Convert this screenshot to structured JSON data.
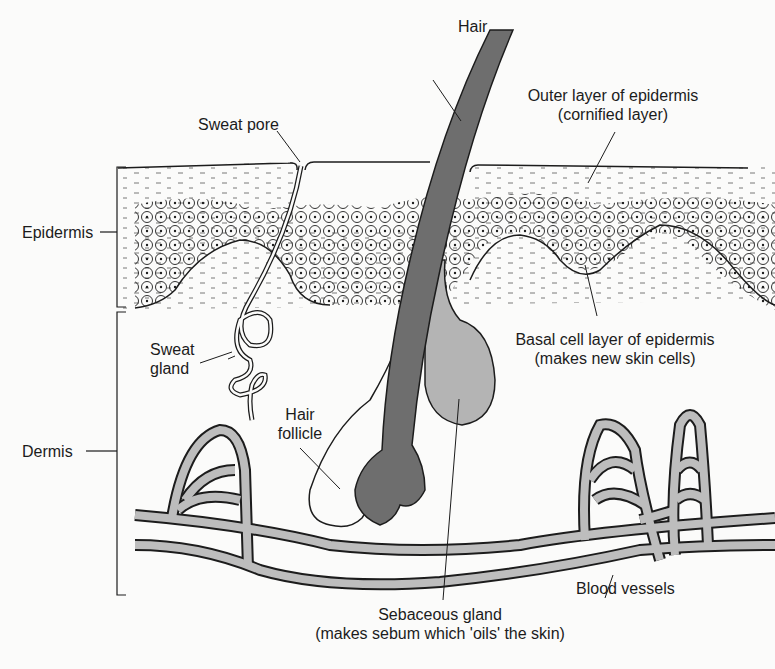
{
  "diagram": {
    "labels": {
      "hair": "Hair",
      "sweat_pore": "Sweat pore",
      "outer_layer_line1": "Outer layer of epidermis",
      "outer_layer_line2": "(cornified layer)",
      "epidermis": "Epidermis",
      "sweat_gland_line1": "Sweat",
      "sweat_gland_line2": "gland",
      "basal_line1": "Basal cell layer of epidermis",
      "basal_line2": "(makes new skin cells)",
      "hair_follicle_line1": "Hair",
      "hair_follicle_line2": "follicle",
      "dermis": "Dermis",
      "blood_vessels": "Blood vessels",
      "sebaceous_line1": "Sebaceous gland",
      "sebaceous_line2": "(makes sebum which 'oils' the skin)"
    },
    "colors": {
      "ink": "#1c1c1c",
      "hair_fill": "#6e6e6e",
      "gland_fill": "#b4b4b4",
      "vessel_fill": "#bdbdbd",
      "background": "#fbfbfa"
    }
  }
}
